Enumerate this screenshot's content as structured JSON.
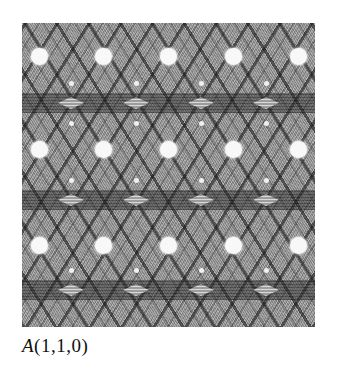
{
  "figure": {
    "caption_prefix": "A",
    "caption_args": "(1,1,0)",
    "caption_full": "A(1,1,0)",
    "spots": [
      {
        "x": 17,
        "y": 33
      },
      {
        "x": 81,
        "y": 33
      },
      {
        "x": 146,
        "y": 33
      },
      {
        "x": 211,
        "y": 33
      },
      {
        "x": 276,
        "y": 33
      },
      {
        "x": 17,
        "y": 126
      },
      {
        "x": 81,
        "y": 126
      },
      {
        "x": 146,
        "y": 126
      },
      {
        "x": 211,
        "y": 126
      },
      {
        "x": 276,
        "y": 126
      },
      {
        "x": 17,
        "y": 222
      },
      {
        "x": 81,
        "y": 222
      },
      {
        "x": 146,
        "y": 222
      },
      {
        "x": 211,
        "y": 222
      },
      {
        "x": 276,
        "y": 222
      }
    ],
    "bands_y": [
      70,
      167,
      257
    ],
    "colors": {
      "background": "#ffffff",
      "pattern_base": "#9a9a9a",
      "spot": "#f8f8f8",
      "text": "#111111"
    }
  }
}
